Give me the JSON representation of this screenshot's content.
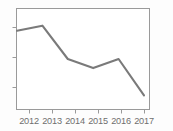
{
  "chart_data": {
    "type": "line",
    "title": "",
    "subtitle": "",
    "xlabel": "",
    "ylabel": "",
    "categories": [
      "2012",
      "2013",
      "2014",
      "2015",
      "2016",
      "2017"
    ],
    "x": [
      2012,
      2013,
      2014,
      2015,
      2016,
      2017
    ],
    "values": [
      78,
      83,
      50,
      41,
      50,
      14
    ],
    "series": [
      {
        "name": "series-1",
        "values": [
          78,
          83,
          50,
          41,
          50,
          14
        ],
        "color": "#7a7a7a"
      }
    ],
    "xlim": [
      2011.8,
      2017.3
    ],
    "ylim": [
      0,
      100
    ],
    "yticks": [
      18,
      42,
      66
    ],
    "ytick_labels": [
      "",
      "",
      ""
    ],
    "grid": false,
    "legend": false,
    "legend_position": "none",
    "markers": false,
    "annotations": []
  },
  "axes": {
    "x_tick_labels": [
      "2012",
      "2013",
      "2014",
      "2015",
      "2016",
      "2017"
    ],
    "y_tick_labels": [
      "",
      "",
      ""
    ],
    "frame_color": "#9a9a9a",
    "tick_color": "#9a9a9a",
    "label_color": "#6e6e6e"
  },
  "figure": {
    "background_color": "#fdfdfd",
    "plot_background_color": "#ffffff",
    "line_color": "#7a7a7a",
    "line_width": 2.1
  }
}
